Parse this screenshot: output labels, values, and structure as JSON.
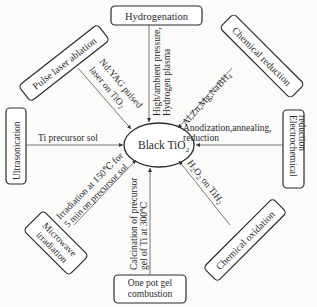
{
  "center": {
    "label": "Black TiO",
    "sub": "2"
  },
  "methods": {
    "hydrogenation": {
      "label": "Hydrogenation",
      "condition": [
        "High/ambient pressure,",
        "Hydrogen plasma"
      ]
    },
    "chemical_reduction": {
      "label": "Chemical reduction",
      "condition": "Al,Zn,Mg,NaBH",
      "condition_sub": "4"
    },
    "electrochemical_reduction": {
      "label": [
        "Electrochemical",
        "reduction"
      ],
      "condition": [
        "Anodization,annealing,",
        "reduction"
      ]
    },
    "chemical_oxidation": {
      "label": "Chemical oxidation",
      "condition_a": "H",
      "condition_a_sub": "2",
      "condition_b": "O",
      "condition_b_sub": "2",
      "condition_c": " on TiH",
      "condition_c_sub": "2"
    },
    "one_pot": {
      "label": [
        "One pot gel",
        "combustion"
      ],
      "condition": [
        "Calcination of precursor",
        "gel of Ti at 300℃"
      ]
    },
    "microwave": {
      "label": [
        "Microwave",
        "irradiation"
      ],
      "condition": [
        "Irradiation at 150℃ for",
        "5 min on precursor sol"
      ]
    },
    "ultrasonication": {
      "label": "Ultrasonication",
      "condition": "Ti precursor sol"
    },
    "pulse_laser": {
      "label": "Pulse laser ablation",
      "condition": [
        "Nd:YAG pulsed",
        "laser on TiO"
      ],
      "condition_sub": "2"
    }
  },
  "colors": {
    "stroke": "#2b2b2b",
    "text": "#2a2a2a",
    "background": "#fbfbfa"
  }
}
